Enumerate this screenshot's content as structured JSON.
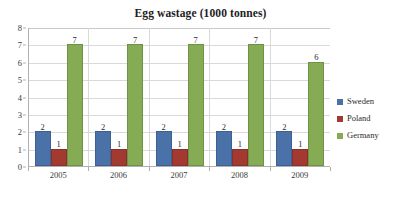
{
  "chart_data": {
    "type": "bar",
    "title": "Egg wastage (1000 tonnes)",
    "xlabel": "",
    "ylabel": "",
    "categories": [
      "2005",
      "2006",
      "2007",
      "2008",
      "2009"
    ],
    "series": [
      {
        "name": "Sweden",
        "color": "#4a72a8",
        "values": [
          2,
          2,
          2,
          2,
          2
        ]
      },
      {
        "name": "Poland",
        "color": "#a33a32",
        "values": [
          1,
          1,
          1,
          1,
          1
        ]
      },
      {
        "name": "Germany",
        "color": "#85ab54",
        "values": [
          7,
          7,
          7,
          7,
          6
        ]
      }
    ],
    "ylim": [
      0,
      8
    ],
    "yticks": [
      0,
      1,
      2,
      3,
      4,
      5,
      6,
      7,
      8
    ],
    "ytick_labels": [
      "0",
      "1",
      "2",
      "3",
      "4",
      "5",
      "6",
      "7",
      "8"
    ],
    "grid": true,
    "grid_axis": "y",
    "data_labels": true,
    "legend_position": "right",
    "background": "#ffffff",
    "gridline_color": "#d9d9d9",
    "axis_color": "#b0b0b0"
  },
  "legend": {
    "entries": [
      {
        "label": "Sweden"
      },
      {
        "label": "Poland"
      },
      {
        "label": "Germany"
      }
    ]
  }
}
